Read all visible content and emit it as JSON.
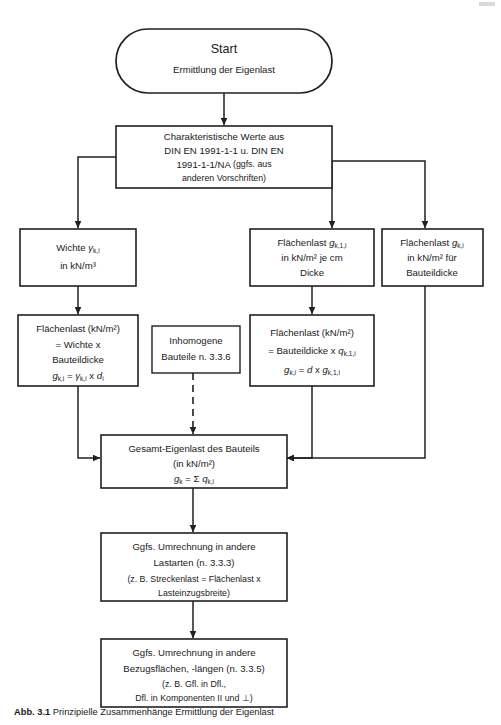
{
  "diagram": {
    "nodes": {
      "start": {
        "title": "Start",
        "subtitle": "Ermittlung der Eigenlast"
      },
      "charakteristische_werte": {
        "line1": "Charakteristische Werte aus",
        "line2": "DIN EN 1991-1-1 u. DIN EN",
        "line3_a": "1991-1-1/NA ",
        "line3_b": "(ggfs. aus",
        "line4": "anderen Vorschriften)"
      },
      "wichte": {
        "line1_a": "Wichte ",
        "line1_sym": "γ",
        "line1_sub": "k,i",
        "line2": "in kN/m³"
      },
      "flaechenlast_je_cm": {
        "line1_a": "Flächenlast ",
        "line1_sym": "g",
        "line1_sub": "k,1,i",
        "line2": "in kN/m² je cm",
        "line3": "Dicke"
      },
      "flaechenlast_bauteildicke": {
        "line1_a": "Flächenlast ",
        "line1_sym": "g",
        "line1_sub": "k,i",
        "line2": "in kN/m² für",
        "line3": "Bauteildicke"
      },
      "flaechenlast_wichte": {
        "line1": "Flächenlast (kN/m²)",
        "line2": "= Wichte x",
        "line3": "Bauteildicke",
        "formula": {
          "lhs_sym": "g",
          "lhs_sub": "k,i",
          "eq": " = ",
          "rhs_sym": "γ",
          "rhs_sub": "k,i",
          "op": " x ",
          "rhs2_sym": "d",
          "rhs2_sub": "i"
        }
      },
      "inhomogene": {
        "line1": "Inhomogene",
        "line2": "Bauteile n. 3.3.6"
      },
      "flaechenlast_dicke": {
        "line1": "Flächenlast (kN/m²)",
        "line2_a": "= Bauteildicke x ",
        "line2_sym": "q",
        "line2_sub": "k,1,i",
        "formula": {
          "lhs_sym": "g",
          "lhs_sub": "k,i",
          "eq": " = ",
          "rhs_sym": "d",
          "op": " x ",
          "rhs2_sym": "g",
          "rhs2_sub": "k,1,i"
        }
      },
      "gesamt": {
        "line1": "Gesamt-Eigenlast des Bauteils",
        "line2": "(in kN/m²)",
        "formula": {
          "lhs_sym": "g",
          "lhs_sub": "k",
          "eq": " = ",
          "sum": "Σ ",
          "rhs_sym": "q",
          "rhs_sub": "k,i"
        }
      },
      "umrechnung_lastarten": {
        "line1": "Ggfs. Umrechnung in andere",
        "line2": "Lastarten (n. 3.3.3)",
        "line3": "(z. B. Streckenlast = Flächenlast x",
        "line4": "Lasteinzugsbreite)"
      },
      "umrechnung_bezugsflaechen": {
        "line1": "Ggfs. Umrechnung in andere",
        "line2": "Bezugsflächen, -längen (n. 3.3.5)",
        "line3": "(z. B. Gfl. in Dfl.,",
        "line4": "Dfl. in Komponenten II und ⊥)"
      }
    },
    "caption": {
      "number": "Abb. 3.1",
      "text": "Prinzipielle Zusammenhänge Ermittlung der Eigenlast"
    },
    "colors": {
      "stroke": "#231f20",
      "fill": "#ffffff",
      "text": "#1a1a1a"
    }
  }
}
